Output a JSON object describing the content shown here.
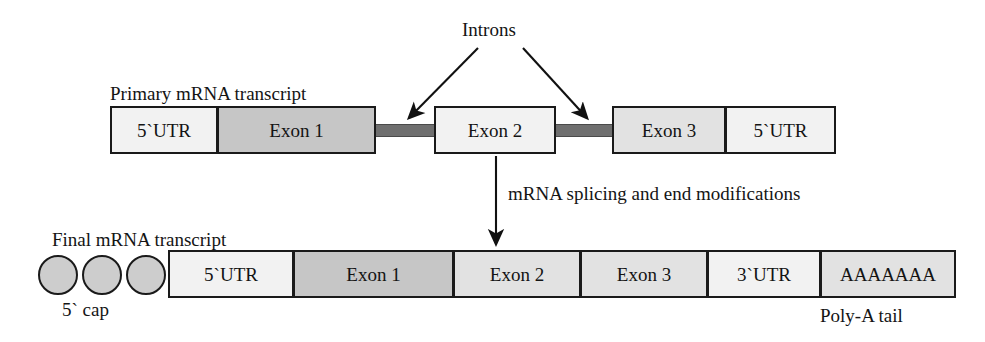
{
  "diagram": {
    "title_text": "mRNA processing diagram",
    "labels": {
      "introns": "Introns",
      "primary_transcript": "Primary mRNA transcript",
      "splicing_step": "mRNA splicing and end modifications",
      "final_transcript": "Final mRNA transcript",
      "five_prime_cap": "5` cap",
      "poly_a_tail": "Poly-A tail"
    },
    "colors": {
      "outline": "#1a1a1a",
      "utr_fill": "#f2f2f2",
      "exon_fill_dark": "#c6c6c6",
      "exon_fill_mid": "#e2e2e2",
      "intron_bar": "#6f6f6f",
      "cap_fill": "#cdcdcd",
      "background": "#ffffff",
      "text": "#141414"
    },
    "primary_transcript": {
      "segments": [
        {
          "label": "5`UTR",
          "shade": "light"
        },
        {
          "label": "Exon 1",
          "shade": "dark"
        },
        {
          "label": "Exon 2",
          "shade": "light"
        },
        {
          "label": "Exon 3",
          "shade": "mid"
        },
        {
          "label": "5`UTR",
          "shade": "light"
        }
      ],
      "intron_count": 2
    },
    "final_transcript": {
      "cap_circle_count": 3,
      "segments": [
        {
          "label": "5`UTR",
          "shade": "light"
        },
        {
          "label": "Exon 1",
          "shade": "dark"
        },
        {
          "label": "Exon 2",
          "shade": "mid"
        },
        {
          "label": "Exon 3",
          "shade": "mid"
        },
        {
          "label": "3`UTR",
          "shade": "light"
        },
        {
          "label": "AAAAAAA",
          "shade": "mid"
        }
      ]
    }
  }
}
